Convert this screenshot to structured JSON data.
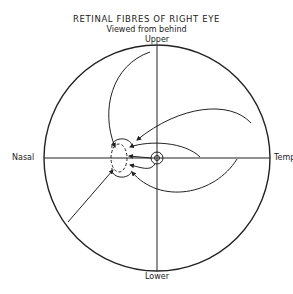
{
  "figure": {
    "title": "RETINAL FIBRES OF RIGHT EYE",
    "subtitle": "Viewed from behind"
  },
  "labels": {
    "upper": "Upper",
    "lower": "Lower",
    "nasal": "Nasal",
    "temporal": "Temp"
  },
  "elements": {
    "outer_circle": "retina-outline",
    "optic_disc": "optic-disc",
    "macula": "macula",
    "fibres": [
      "upper-nasal-fibre",
      "upper-temporal-fibre",
      "papillomacular-fibre",
      "lower-temporal-fibre",
      "lower-nasal-fibre"
    ]
  },
  "colors": {
    "line": "#222222",
    "background": "#ffffff"
  }
}
